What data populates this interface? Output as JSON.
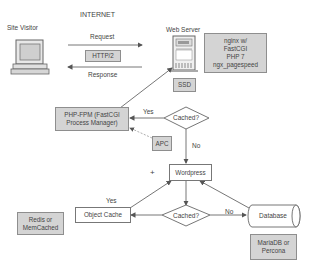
{
  "diagram": {
    "colors": {
      "grey_box": "#d4d4d4",
      "border": "#777777",
      "line": "#666666",
      "background": "#ffffff"
    },
    "labels": {
      "internet": "INTERNET",
      "site_visitor": "Site Visitor",
      "request": "Request",
      "response": "Response",
      "web_server": "Web Server",
      "yes_top": "Yes",
      "no_top": "No",
      "yes_bottom": "Yes",
      "no_bottom": "No",
      "plus": "+"
    },
    "nodes": {
      "http2": "HTTP/2",
      "server_stack": [
        "nginx w/",
        "FastCGI",
        "PHP 7",
        "ngx_pagespeed"
      ],
      "ssd": "SSD",
      "php_fpm": [
        "PHP-FPM (FastCGI",
        "Process Manager)"
      ],
      "cached_top": "Cached?",
      "apc": "APC",
      "wordpress": "Wordpress",
      "cached_bottom": "Cached?",
      "object_cache": "Object Cache",
      "database": "Database",
      "redis": [
        "Redis or",
        "MemCached"
      ],
      "mariadb": [
        "MariaDB or",
        "Percona"
      ]
    },
    "icons": {
      "site_visitor": "computer-icon",
      "web_server": "server-icon",
      "database": "cylinder-icon"
    }
  }
}
